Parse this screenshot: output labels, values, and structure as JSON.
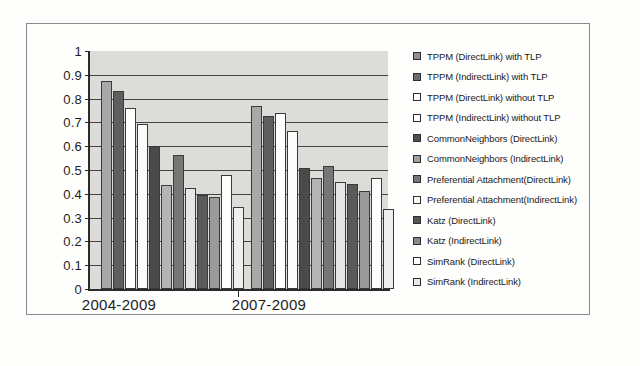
{
  "chart_data": {
    "type": "bar",
    "title": "",
    "xlabel": "",
    "ylabel": "",
    "ylim": [
      0,
      1
    ],
    "ytick_labels": [
      "1",
      "0.9",
      "0.8",
      "0.7",
      "0.6",
      "0.5",
      "0.4",
      "0.3",
      "0.2",
      "0.1",
      "0"
    ],
    "ytick_values": [
      1,
      0.9,
      0.8,
      0.7,
      0.6,
      0.5,
      0.4,
      0.3,
      0.2,
      0.1,
      0
    ],
    "grid": true,
    "legend_position": "right",
    "categories": [
      "2004-2009",
      "2007-2009"
    ],
    "series": [
      {
        "name": "TPPM (DirectLink) with TLP",
        "color": "#a8a8a8",
        "values": [
          0.875,
          0.77
        ]
      },
      {
        "name": "TPPM (IndirectLink) with TLP",
        "color": "#5e5e5e",
        "values": [
          0.83,
          0.725
        ]
      },
      {
        "name": "TPPM (DirectLink) without TLP",
        "color": "#ffffff",
        "values": [
          0.76,
          0.74
        ]
      },
      {
        "name": "TPPM (IndirectLink) without TLP",
        "color": "#fbfbfb",
        "values": [
          0.695,
          0.665
        ]
      },
      {
        "name": "CommonNeighbors (DirectLink)",
        "color": "#4a4a4a",
        "values": [
          0.6,
          0.51
        ]
      },
      {
        "name": "CommonNeighbors (IndirectLink)",
        "color": "#b4b4b4",
        "values": [
          0.435,
          0.465
        ]
      },
      {
        "name": "Preferential Attachment(DirectLink)",
        "color": "#767676",
        "values": [
          0.565,
          0.515
        ]
      },
      {
        "name": "Preferential Attachment(IndirectLink)",
        "color": "#e6e6e6",
        "values": [
          0.425,
          0.45
        ]
      },
      {
        "name": "Katz (DirectLink)",
        "color": "#5a5a5a",
        "values": [
          0.395,
          0.44
        ]
      },
      {
        "name": "Katz (IndirectLink)",
        "color": "#9a9a9a",
        "values": [
          0.385,
          0.41
        ]
      },
      {
        "name": "SimRank (DirectLink)",
        "color": "#fdfdfd",
        "values": [
          0.48,
          0.465
        ]
      },
      {
        "name": "SimRank (IndirectLink)",
        "color": "#efefef",
        "values": [
          0.345,
          0.335
        ]
      }
    ],
    "legend_entries": [
      "TPPM (DirectLink) with TLP",
      "TPPM (IndirectLink) with TLP",
      "TPPM (DirectLink) without TLP",
      "TPPM (IndirectLink) without TLP",
      "CommonNeighbors (DirectLink)",
      "CommonNeighbors (IndirectLink)",
      "Preferential Attachment(DirectLink)",
      "Preferential Attachment(IndirectLink)",
      "Katz (DirectLink)",
      "Katz (IndirectLink)",
      "SimRank (DirectLink)",
      "SimRank (IndirectLink)"
    ],
    "legend_swatch_colors": [
      "#8f8f8f",
      "#6b6b6b",
      "#ffffff",
      "#ffffff",
      "#4f4f4f",
      "#a0a0a0",
      "#787878",
      "#ffffff",
      "#565656",
      "#8a8a8a",
      "#ffffff",
      "#e8e8e8"
    ]
  }
}
